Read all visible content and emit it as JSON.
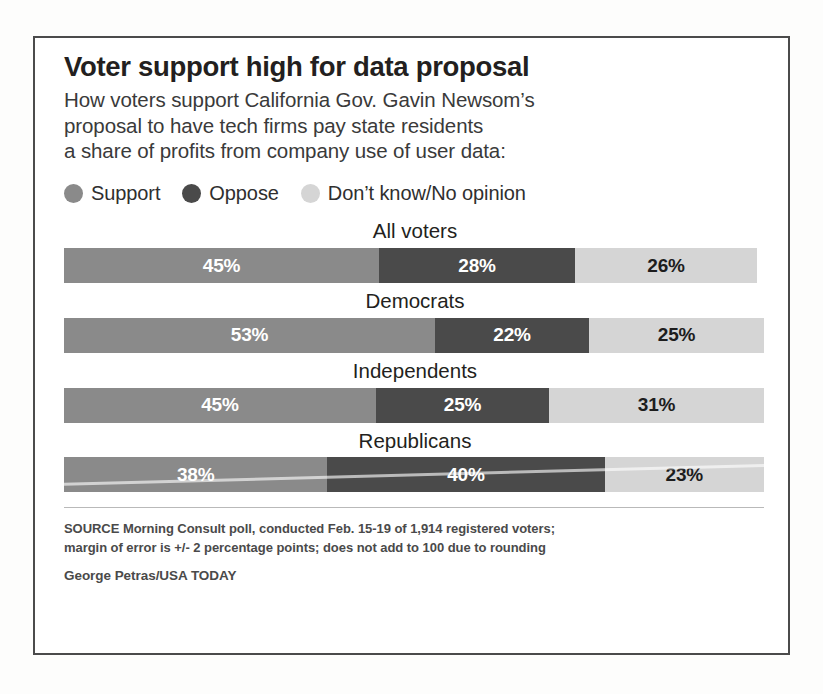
{
  "headline": "Voter support high for data proposal",
  "deck": [
    "How voters support California Gov. Gavin Newsom’s",
    "proposal to have tech firms pay state residents",
    "a share of profits from company use of user data:"
  ],
  "legend": [
    {
      "label": "Support",
      "color": "#8a8a8a",
      "icon": "circle-swatch-support"
    },
    {
      "label": "Oppose",
      "color": "#4a4a4a",
      "icon": "circle-swatch-oppose"
    },
    {
      "label": "Don’t know/No opinion",
      "color": "#d5d5d5",
      "icon": "circle-swatch-dont-know"
    }
  ],
  "footer": {
    "source": [
      "SOURCE Morning Consult poll, conducted Feb. 15-19 of 1,914 registered voters;",
      "margin of error is +/- 2 percentage points; does not add to 100 due to rounding"
    ],
    "credit": "George Petras/USA TODAY"
  },
  "chart_data": {
    "type": "bar",
    "orientation": "horizontal",
    "stacked": true,
    "title": "Voter support high for data proposal",
    "subtitle": "How voters support California Gov. Gavin Newsom’s proposal to have tech firms pay state residents a share of profits from company use of user data:",
    "xlabel": "",
    "ylabel": "",
    "unit": "percent",
    "xlim": [
      0,
      100
    ],
    "grid": false,
    "legend_position": "top",
    "categories": [
      "All voters",
      "Democrats",
      "Independents",
      "Republicans"
    ],
    "series": [
      {
        "name": "Support",
        "color": "#8a8a8a",
        "values": [
          45,
          53,
          45,
          38
        ],
        "labels": [
          "45%",
          "53%",
          "45%",
          "38%"
        ]
      },
      {
        "name": "Oppose",
        "color": "#4a4a4a",
        "values": [
          28,
          22,
          25,
          40
        ],
        "labels": [
          "28%",
          "22%",
          "25%",
          "40%"
        ]
      },
      {
        "name": "Don’t know/No opinion",
        "color": "#d5d5d5",
        "values": [
          26,
          25,
          31,
          23
        ],
        "labels": [
          "26%",
          "25%",
          "31%",
          "23%"
        ]
      }
    ],
    "row_totals": [
      99,
      100,
      101,
      101
    ],
    "note": "does not add to 100 due to rounding"
  }
}
